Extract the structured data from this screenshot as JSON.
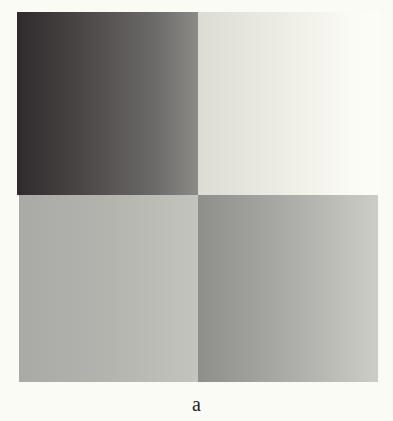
{
  "figure": {
    "caption": "a",
    "panels": [
      {
        "position": "top-left",
        "gradient": [
          "#2f2a2b",
          "#8c8b88"
        ],
        "description": "dark gradient, darker on left"
      },
      {
        "position": "top-right",
        "gradient": [
          "#dcdcd4",
          "#fdfdf8"
        ],
        "description": "light gradient, lighter on right"
      },
      {
        "position": "bottom-left",
        "gradient": [
          "#a9a9a5",
          "#c4c4be"
        ],
        "description": "medium-light gray gradient"
      },
      {
        "position": "bottom-right",
        "gradient": [
          "#8e8e8b",
          "#cdcdc7"
        ],
        "description": "medium gray gradient, lighter on right"
      }
    ],
    "background": "#fbfbf6"
  }
}
